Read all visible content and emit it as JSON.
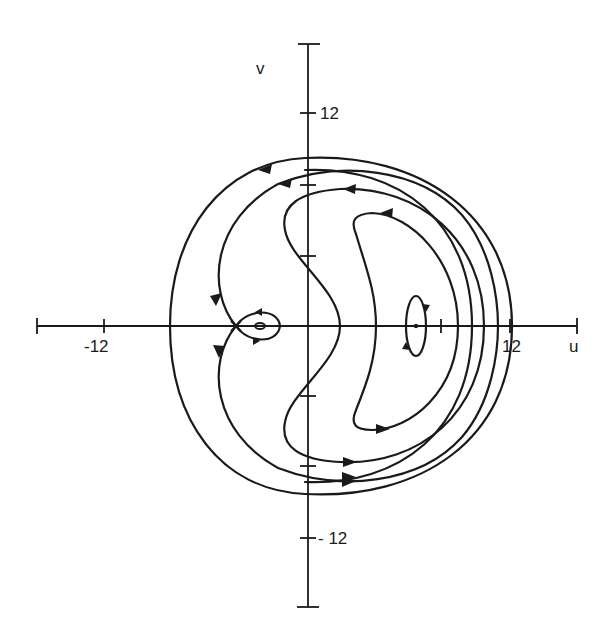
{
  "figure": {
    "type": "phase-portrait",
    "axes": {
      "x_label": "u",
      "y_label": "v",
      "x_ticks": [
        {
          "value": -12,
          "label": "-12"
        },
        {
          "value": 12,
          "label": "12"
        }
      ],
      "y_ticks": [
        {
          "value": 12,
          "label": "12"
        },
        {
          "value": -12,
          "label": "- 12"
        }
      ]
    },
    "fixed_points": [
      {
        "kind": "saddle",
        "u": -4.2,
        "v": 0
      },
      {
        "kind": "center",
        "u": -2.8,
        "v": 0
      },
      {
        "kind": "center",
        "u": 6.3,
        "v": 0
      }
    ],
    "trajectories": [
      {
        "name": "outer-closed-orbit",
        "direction": "counterclockwise"
      },
      {
        "name": "separatrix-outer",
        "direction": "counterclockwise"
      },
      {
        "name": "nested-orbit",
        "direction": "counterclockwise"
      },
      {
        "name": "crescent-orbit",
        "direction": "counterclockwise"
      },
      {
        "name": "small-loop-around-left-center",
        "direction": "counterclockwise"
      },
      {
        "name": "small-orbit-around-right-center",
        "direction": "counterclockwise"
      },
      {
        "name": "inner-crescent-between-separatrices",
        "direction": "counterclockwise"
      }
    ]
  }
}
